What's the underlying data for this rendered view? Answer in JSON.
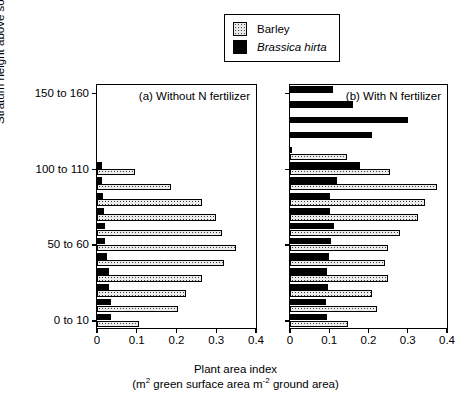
{
  "legend": {
    "items": [
      {
        "label": "Barley",
        "key": "barley",
        "color": "#e8e8e8",
        "italic": false
      },
      {
        "label": "Brassica hirta",
        "key": "brassica",
        "color": "#000000",
        "italic": true
      }
    ]
  },
  "axes": {
    "ylabel_line1": "Stratum height above soil surface (cm)",
    "xlabel_line1": "Plant area index",
    "xlabel_line2_pre": "(m",
    "xlabel_line2_mid": " green surface area m",
    "xlabel_line2_post": " ground area)",
    "xsup1": "2",
    "xsup2": "-2",
    "xticks": [
      "0",
      "0.1",
      "0.2",
      "0.3",
      "0.4"
    ],
    "xtickvals": [
      0,
      0.1,
      0.2,
      0.3,
      0.4
    ],
    "xlim": [
      0,
      0.4
    ],
    "yticklabels": [
      "150 to 160",
      "100 to 110",
      "50 to 60",
      "0 to 10"
    ],
    "ytickstrata": [
      15,
      10,
      5,
      0
    ]
  },
  "chart_data": {
    "type": "bar",
    "orientation": "horizontal",
    "title": "",
    "xlabel": "Plant area index (m2 green surface area m-2 ground area)",
    "ylabel": "Stratum height above soil surface (cm)",
    "xlim": [
      0,
      0.4
    ],
    "grid": false,
    "legend_position": "top-center",
    "categories": [
      "0 to 10",
      "10 to 20",
      "20 to 30",
      "30 to 40",
      "40 to 50",
      "50 to 60",
      "60 to 70",
      "70 to 80",
      "80 to 90",
      "90 to 100",
      "100 to 110",
      "110 to 120",
      "120 to 130",
      "130 to 140",
      "140 to 150",
      "150 to 160"
    ],
    "panels": [
      {
        "id": "a",
        "title": "(a) Without N fertilizer",
        "series": [
          {
            "name": "Barley",
            "key": "barley",
            "values": [
              0.105,
              0.205,
              0.225,
              0.265,
              0.32,
              0.35,
              0.315,
              0.3,
              0.265,
              0.185,
              0.095,
              0,
              0,
              0,
              0,
              0
            ]
          },
          {
            "name": "Brassica hirta",
            "key": "brassica",
            "values": [
              0.035,
              0.035,
              0.03,
              0.03,
              0.025,
              0.02,
              0.02,
              0.018,
              0.015,
              0.013,
              0.012,
              0,
              0,
              0,
              0,
              0
            ]
          }
        ]
      },
      {
        "id": "b",
        "title": "(b) With N fertilizer",
        "series": [
          {
            "name": "Barley",
            "key": "barley",
            "values": [
              0.148,
              0.222,
              0.21,
              0.25,
              0.243,
              0.25,
              0.28,
              0.325,
              0.345,
              0.375,
              0.255,
              0.145,
              0,
              0,
              0,
              0
            ]
          },
          {
            "name": "Brassica hirta",
            "key": "brassica",
            "values": [
              0.095,
              0.092,
              0.098,
              0.093,
              0.1,
              0.105,
              0.113,
              0.102,
              0.103,
              0.12,
              0.178,
              0.005,
              0.21,
              0.3,
              0.16,
              0.11,
              0.052
            ]
          }
        ]
      }
    ]
  }
}
